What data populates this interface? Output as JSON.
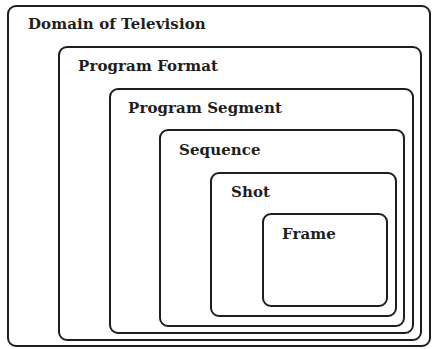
{
  "diagram": {
    "type": "nested-boxes",
    "levels": [
      {
        "label": "Domain of Television"
      },
      {
        "label": "Program Format"
      },
      {
        "label": "Program Segment"
      },
      {
        "label": "Sequence"
      },
      {
        "label": "Shot"
      },
      {
        "label": "Frame"
      }
    ]
  }
}
